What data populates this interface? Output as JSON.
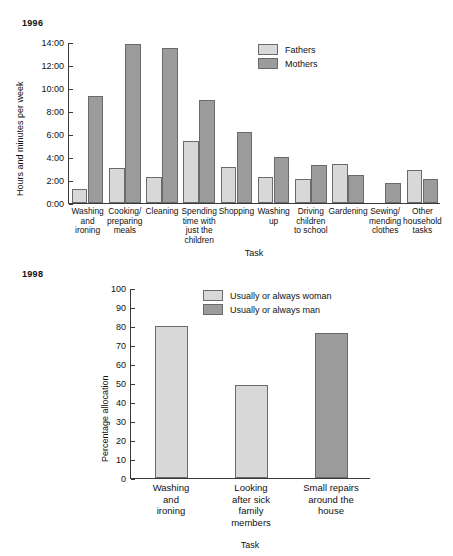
{
  "chart_data": [
    {
      "type": "bar",
      "title": "1996",
      "xlabel": "Task",
      "ylabel": "Hours and minutes per week",
      "ylim": [
        0,
        14
      ],
      "ytick_labels": [
        "0:00",
        "2:00",
        "4:00",
        "6:00",
        "8:00",
        "10:00",
        "12:00",
        "14:00"
      ],
      "ytick_values": [
        0,
        2,
        4,
        6,
        8,
        10,
        12,
        14
      ],
      "grid": false,
      "legend_position": "top-right",
      "categories": [
        "Washing\nand\nironing",
        "Cooking/\npreparing\nmeals",
        "Cleaning",
        "Spending\ntime with\njust the\nchildren",
        "Shopping",
        "Washing\nup",
        "Driving\nchildren\nto school",
        "Gardening",
        "Sewing/\nmending\nclothes",
        "Other\nhousehold\ntasks"
      ],
      "series": [
        {
          "name": "Fathers",
          "color": "#d8d8d8",
          "values": [
            1.2,
            3.05,
            2.3,
            5.4,
            3.1,
            2.3,
            2.1,
            3.35,
            0,
            2.85
          ]
        },
        {
          "name": "Mothers",
          "color": "#9b9b9b",
          "values": [
            9.3,
            13.8,
            13.5,
            9.0,
            6.2,
            4.0,
            3.3,
            2.4,
            1.75,
            2.1
          ]
        }
      ]
    },
    {
      "type": "bar",
      "title": "1998",
      "xlabel": "Task",
      "ylabel": "Percentage allocation",
      "ylim": [
        0,
        100
      ],
      "ytick_labels": [
        "0",
        "10",
        "20",
        "30",
        "40",
        "50",
        "60",
        "70",
        "80",
        "90",
        "100"
      ],
      "ytick_values": [
        0,
        10,
        20,
        30,
        40,
        50,
        60,
        70,
        80,
        90,
        100
      ],
      "grid": false,
      "legend_position": "top-center",
      "categories": [
        "Washing\nand\nironing",
        "Looking\nafter sick\nfamily\nmembers",
        "Small repairs\naround the\nhouse"
      ],
      "legend_entries": [
        {
          "name": "Usually or always woman",
          "color": "#d8d8d8"
        },
        {
          "name": "Usually or always man",
          "color": "#9b9b9b"
        }
      ],
      "values": [
        80,
        49,
        76.5
      ],
      "value_groups": [
        "Usually or always woman",
        "Usually or always woman",
        "Usually or always man"
      ]
    }
  ]
}
